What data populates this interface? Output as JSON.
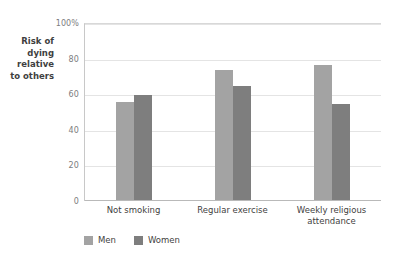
{
  "chart_data": {
    "type": "bar",
    "title": "",
    "subtitle": "",
    "xlabel": "",
    "ylabel": "Risk of\ndying\nrelative\nto others",
    "categories": [
      "Not smoking",
      "Regular exercise",
      "Weekly religious attendance"
    ],
    "series": [
      {
        "name": "Men",
        "color": "#a3a3a3",
        "values": [
          55,
          73,
          76
        ]
      },
      {
        "name": "Women",
        "color": "#7e7e7e",
        "values": [
          59,
          64,
          54
        ]
      }
    ],
    "ylim": [
      0,
      100
    ],
    "yticks": [
      {
        "value": 100,
        "label": "100%"
      },
      {
        "value": 80,
        "label": "80"
      },
      {
        "value": 60,
        "label": "60"
      },
      {
        "value": 40,
        "label": "40"
      },
      {
        "value": 20,
        "label": "20"
      },
      {
        "value": 0,
        "label": "0"
      }
    ],
    "grid": true,
    "legend_position": "bottom-left",
    "legend": [
      "Men",
      "Women"
    ],
    "background_color": "#ffffff",
    "axis_color": "#c8c8c8",
    "grid_color": "#e4e4e4",
    "text_color": "#3f3f41"
  }
}
